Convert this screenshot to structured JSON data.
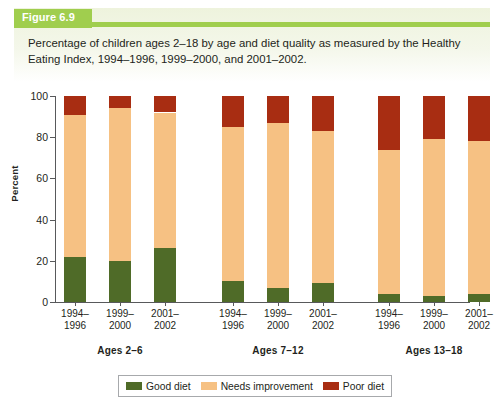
{
  "figure": {
    "tag_label": "Figure 6.9",
    "caption": "Percentage of children ages 2–18 by age and diet quality as measured by the Healthy Eating Index, 1994–1996, 1999–2000, and 2001–2002."
  },
  "legend": {
    "items": [
      {
        "label": "Good diet",
        "color": "#4f6b28"
      },
      {
        "label": "Needs improvement",
        "color": "#f6c183"
      },
      {
        "label": "Poor diet",
        "color": "#a82d12"
      }
    ]
  },
  "chart_data": {
    "type": "bar",
    "stacked": true,
    "title": "Percentage of children ages 2–18 by age and diet quality as measured by the Healthy Eating Index, 1994–1996, 1999–2000, and 2001–2002.",
    "xlabel": "",
    "ylabel": "Percent",
    "ylim": [
      0,
      100
    ],
    "yticks": [
      0,
      20,
      40,
      60,
      80,
      100
    ],
    "ytick_labels": [
      "0",
      "20",
      "40",
      "60",
      "80",
      "100"
    ],
    "grid": false,
    "legend_position": "bottom",
    "groups": [
      {
        "name": "Ages 2–6",
        "categories": [
          "1994–1996",
          "1999–2000",
          "2001–2002"
        ]
      },
      {
        "name": "Ages 7–12",
        "categories": [
          "1994–1996",
          "1999–2000",
          "2001–2002"
        ]
      },
      {
        "name": "Ages 13–18",
        "categories": [
          "1994–1996",
          "1999–2000",
          "2001–2002"
        ]
      }
    ],
    "categories": [
      "Ages 2–6 / 1994–1996",
      "Ages 2–6 / 1999–2000",
      "Ages 2–6 / 2001–2002",
      "Ages 7–12 / 1994–1996",
      "Ages 7–12 / 1999–2000",
      "Ages 7–12 / 2001–2002",
      "Ages 13–18 / 1994–1996",
      "Ages 13–18 / 1999–2000",
      "Ages 13–18 / 2001–2002"
    ],
    "series": [
      {
        "name": "Good diet",
        "color": "#4f6b28",
        "values": [
          22,
          20,
          26,
          10,
          7,
          9,
          4,
          3,
          4
        ]
      },
      {
        "name": "Needs improvement",
        "color": "#f6c183",
        "values": [
          69,
          74,
          66,
          75,
          80,
          74,
          70,
          76,
          74
        ]
      },
      {
        "name": "Poor diet",
        "color": "#a82d12",
        "values": [
          9,
          6,
          8,
          15,
          13,
          17,
          26,
          21,
          22
        ]
      }
    ]
  }
}
